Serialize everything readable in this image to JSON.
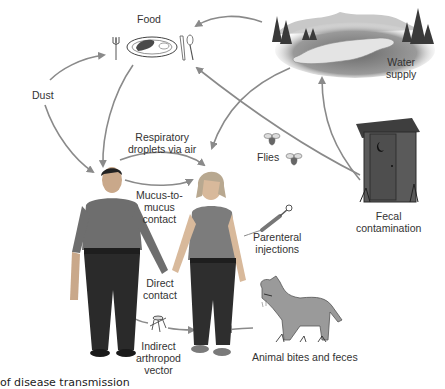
{
  "diagram": {
    "type": "disease-transmission-routes",
    "nodes": [
      {
        "id": "food",
        "label": "Food",
        "icon": "plate-fork-knife-spoon-icon"
      },
      {
        "id": "water",
        "label_line1": "Water",
        "label_line2": "supply",
        "icon": "lake-landscape-icon"
      },
      {
        "id": "dust",
        "label": "Dust"
      },
      {
        "id": "respiratory",
        "label_line1": "Respiratory",
        "label_line2": "droplets via air"
      },
      {
        "id": "mucus",
        "label_line1": "Mucus-to-",
        "label_line2": "mucus",
        "label_line3": "contact"
      },
      {
        "id": "flies",
        "label": "Flies",
        "icon": "fly-icon"
      },
      {
        "id": "fecal",
        "label_line1": "Fecal",
        "label_line2": "contamination",
        "icon": "outhouse-icon"
      },
      {
        "id": "parenteral",
        "label_line1": "Parenteral",
        "label_line2": "injections",
        "icon": "syringe-icon"
      },
      {
        "id": "direct",
        "label_line1": "Direct",
        "label_line2": "contact"
      },
      {
        "id": "arthropod",
        "label_line1": "Indirect",
        "label_line2": "arthropod",
        "label_line3": "vector",
        "icon": "mosquito-icon"
      },
      {
        "id": "animal",
        "label": "Animal bites and feces",
        "icon": "dog-icon"
      }
    ],
    "people": [
      "man-figure",
      "woman-figure"
    ],
    "caption": "of disease transmission",
    "colors": {
      "arrow": "#8a8a8a",
      "text": "#333333",
      "figure_dark": "#2e2e2e",
      "figure_mid": "#7a7a7a"
    }
  }
}
